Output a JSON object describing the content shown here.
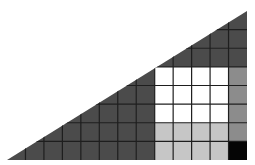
{
  "diagram": {
    "grid": {
      "cols": 13,
      "rows": 8,
      "cell_size": 18.46
    },
    "triangle": {
      "left": [
        7,
        160
      ],
      "right": [
        247,
        160
      ],
      "top": [
        247,
        11
      ]
    },
    "colors": {
      "dark": "#4b4b4b",
      "white": "#ffffff",
      "light": "#c6c6c6",
      "medium": "#8c8c8c",
      "black": "#050505",
      "line": "#1e1e1e"
    },
    "regions": [
      {
        "name": "white-block",
        "color": "white",
        "col_start": 8,
        "col_end": 11,
        "row_start": 3,
        "row_end": 5
      },
      {
        "name": "light-gray-block",
        "color": "light",
        "col_start": 8,
        "col_end": 11,
        "row_start": 6,
        "row_end": 7
      },
      {
        "name": "medium-gray-column",
        "color": "medium",
        "col_start": 12,
        "col_end": 12,
        "row_start": 3,
        "row_end": 6
      },
      {
        "name": "black-cell",
        "color": "black",
        "col_start": 12,
        "col_end": 12,
        "row_start": 7,
        "row_end": 7
      }
    ]
  }
}
